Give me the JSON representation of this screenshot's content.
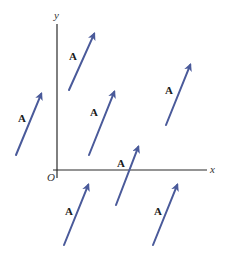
{
  "figure": {
    "axes": {
      "x_label": "x",
      "y_label": "y",
      "origin_label": "O",
      "origin": [
        57,
        170
      ],
      "x_axis_end": [
        207,
        170
      ],
      "y_axis_start": [
        57,
        24
      ],
      "y_axis_end": [
        57,
        178
      ],
      "x_axis_start": [
        53,
        170
      ],
      "axis_color": "#2a2a2a"
    },
    "vector_color": "#4a5a9a",
    "vectors": [
      {
        "label": "A",
        "tail": [
          69,
          90
        ],
        "head": [
          95,
          32
        ],
        "label_pos": [
          69,
          60
        ]
      },
      {
        "label": "A",
        "tail": [
          16,
          155
        ],
        "head": [
          42,
          92
        ],
        "label_pos": [
          18,
          122
        ]
      },
      {
        "label": "A",
        "tail": [
          89,
          155
        ],
        "head": [
          115,
          90
        ],
        "label_pos": [
          90,
          116
        ]
      },
      {
        "label": "A",
        "tail": [
          166,
          125
        ],
        "head": [
          191,
          63
        ],
        "label_pos": [
          165,
          94
        ]
      },
      {
        "label": "A",
        "tail": [
          116,
          205
        ],
        "head": [
          139,
          145
        ],
        "label_pos": [
          117,
          167
        ]
      },
      {
        "label": "A",
        "tail": [
          64,
          245
        ],
        "head": [
          89,
          183
        ],
        "label_pos": [
          65,
          215
        ]
      },
      {
        "label": "A",
        "tail": [
          153,
          245
        ],
        "head": [
          178,
          183
        ],
        "label_pos": [
          154,
          215
        ]
      }
    ]
  }
}
